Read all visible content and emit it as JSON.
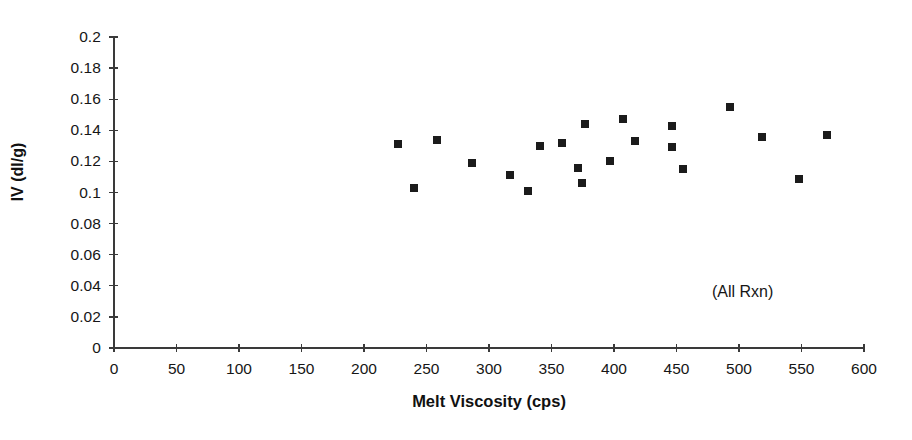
{
  "chart_data": {
    "type": "scatter",
    "title": "",
    "xlabel": "Melt Viscosity (cps)",
    "ylabel": "IV (dl/g)",
    "xlim": [
      0,
      600
    ],
    "ylim": [
      0,
      0.2
    ],
    "grid": false,
    "legend": null,
    "annotation": "(All Rxn)",
    "marker_style": "filled-square",
    "marker_color": "#1b1b1b",
    "xticks": [
      0,
      50,
      100,
      150,
      200,
      250,
      300,
      350,
      400,
      450,
      500,
      550,
      600
    ],
    "xtick_labels": [
      "0",
      "50",
      "100",
      "150",
      "200",
      "250",
      "300",
      "350",
      "400",
      "450",
      "500",
      "550",
      "600"
    ],
    "yticks": [
      0,
      0.02,
      0.04,
      0.06,
      0.08,
      0.1,
      0.12,
      0.14,
      0.16,
      0.18,
      0.2
    ],
    "ytick_labels": [
      "0",
      "0.02",
      "0.04",
      "0.06",
      "0.08",
      "0.1",
      "0.12",
      "0.14",
      "0.16",
      "0.18",
      "0.2"
    ],
    "series": [
      {
        "name": "All Rxn",
        "x": [
          227,
          240,
          258,
          286,
          317,
          331,
          341,
          358,
          371,
          374,
          377,
          397,
          407,
          417,
          446,
          446,
          455,
          493,
          518,
          548,
          570
        ],
        "y": [
          0.131,
          0.103,
          0.134,
          0.119,
          0.111,
          0.101,
          0.13,
          0.132,
          0.116,
          0.106,
          0.144,
          0.12,
          0.147,
          0.133,
          0.129,
          0.143,
          0.115,
          0.155,
          0.136,
          0.109,
          0.137
        ]
      }
    ]
  }
}
